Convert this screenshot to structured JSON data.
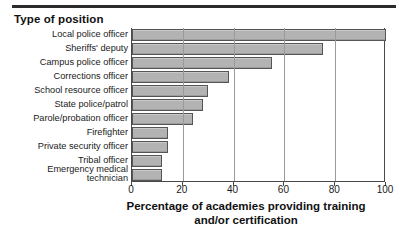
{
  "header": {
    "title": "Type of position"
  },
  "chart_data": {
    "type": "bar",
    "orientation": "horizontal",
    "title": "Type of position",
    "xlabel": "Percentage of academies providing training and/or certification",
    "ylabel": "Type of position",
    "xlim": [
      0,
      100
    ],
    "xticks": [
      0,
      20,
      40,
      60,
      80,
      100
    ],
    "grid": "vertical",
    "legend": "none",
    "bar_color": "#b3b3b3",
    "bar_edge_color": "#555555",
    "categories": [
      "Local police officer",
      "Sheriffs' deputy",
      "Campus police officer",
      "Corrections officer",
      "School resource officer",
      "State police/patrol",
      "Parole/probation officer",
      "Firefighter",
      "Private security officer",
      "Tribal officer",
      "Emergency medical\ntechnician"
    ],
    "values": [
      100,
      75,
      55,
      38,
      30,
      28,
      24,
      14,
      14,
      12,
      12
    ]
  },
  "axis": {
    "title_line1": "Percentage of academies providing training",
    "title_line2": "and/or certification",
    "tick_labels": [
      "0",
      "20",
      "40",
      "60",
      "80",
      "100"
    ]
  }
}
